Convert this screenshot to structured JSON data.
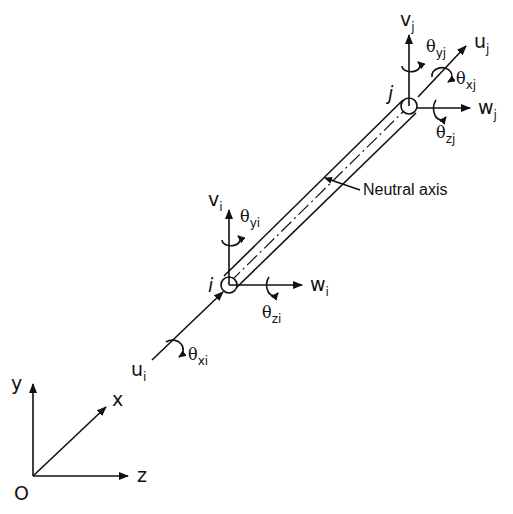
{
  "diagram": {
    "type": "3D beam element degrees of freedom",
    "global_axes": {
      "origin": "O",
      "x": "x",
      "y": "y",
      "z": "z"
    },
    "element": {
      "axis_label": "Neutral axis"
    },
    "node_i": {
      "label": "i",
      "u": {
        "base": "u",
        "sub": "i"
      },
      "v": {
        "base": "v",
        "sub": "i"
      },
      "w": {
        "base": "w",
        "sub": "i"
      },
      "theta_x": {
        "base": "θ",
        "sub": "xi"
      },
      "theta_y": {
        "base": "θ",
        "sub": "yi"
      },
      "theta_z": {
        "base": "θ",
        "sub": "zi"
      }
    },
    "node_j": {
      "label": "j",
      "u": {
        "base": "u",
        "sub": "j"
      },
      "v": {
        "base": "v",
        "sub": "j"
      },
      "w": {
        "base": "w",
        "sub": "j"
      },
      "theta_x": {
        "base": "θ",
        "sub": "xj"
      },
      "theta_y": {
        "base": "θ",
        "sub": "yj"
      },
      "theta_z": {
        "base": "θ",
        "sub": "zj"
      }
    }
  }
}
